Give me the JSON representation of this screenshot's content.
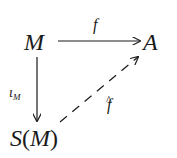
{
  "diagram": {
    "type": "commutative-diagram",
    "nodes": {
      "top_left": "M",
      "top_right": "A",
      "bottom_left": {
        "functor": "S",
        "open": "(",
        "arg": "M",
        "close": ")"
      }
    },
    "arrows": {
      "top": {
        "from": "M",
        "to": "A",
        "label": "f",
        "style": "solid"
      },
      "left": {
        "from": "M",
        "to": "S(M)",
        "label_base": "ι",
        "label_sub": "M",
        "style": "solid"
      },
      "diagonal": {
        "from": "S(M)",
        "to": "A",
        "label": "f",
        "label_accent": "^",
        "style": "dashed"
      }
    },
    "colors": {
      "ink": "#1a1a1a",
      "background": "#ffffff"
    }
  }
}
